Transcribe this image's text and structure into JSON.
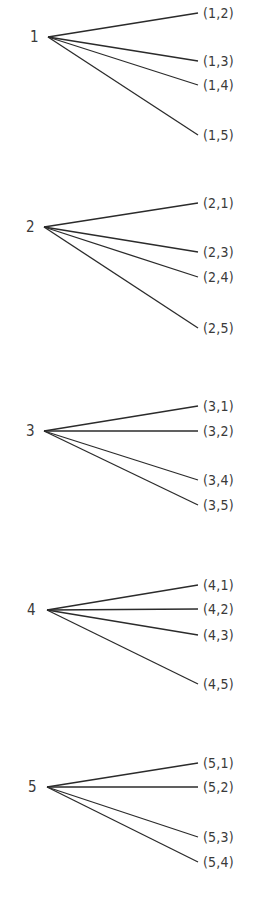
{
  "diagram": {
    "type": "tree",
    "line_color": "#2b2b2b",
    "text_color": "#3a3a3a",
    "groups": [
      {
        "root": "1",
        "root_x": 30,
        "node_x": 48,
        "y": 37,
        "leaves": [
          {
            "label": "(1,2)",
            "y": 13
          },
          {
            "label": "(1,3)",
            "y": 61
          },
          {
            "label": "(1,4)",
            "y": 85
          },
          {
            "label": "(1,5)",
            "y": 135
          }
        ]
      },
      {
        "root": "2",
        "root_x": 26,
        "node_x": 44,
        "y": 227,
        "leaves": [
          {
            "label": "(2,1)",
            "y": 203
          },
          {
            "label": "(2,3)",
            "y": 252
          },
          {
            "label": "(2,4)",
            "y": 277
          },
          {
            "label": "(2,5)",
            "y": 328
          }
        ]
      },
      {
        "root": "3",
        "root_x": 26,
        "node_x": 44,
        "y": 431,
        "leaves": [
          {
            "label": "(3,1)",
            "y": 406
          },
          {
            "label": "(3,2)",
            "y": 431
          },
          {
            "label": "(3,4)",
            "y": 480
          },
          {
            "label": "(3,5)",
            "y": 505
          }
        ]
      },
      {
        "root": "4",
        "root_x": 27,
        "node_x": 47,
        "y": 610,
        "leaves": [
          {
            "label": "(4,1)",
            "y": 585
          },
          {
            "label": "(4,2)",
            "y": 609
          },
          {
            "label": "(4,3)",
            "y": 635
          },
          {
            "label": "(4,5)",
            "y": 684
          }
        ]
      },
      {
        "root": "5",
        "root_x": 28,
        "node_x": 47,
        "y": 787,
        "leaves": [
          {
            "label": "(5,1)",
            "y": 763
          },
          {
            "label": "(5,2)",
            "y": 787
          },
          {
            "label": "(5,3)",
            "y": 837
          },
          {
            "label": "(5,4)",
            "y": 862
          }
        ]
      }
    ],
    "leaf_line_end_x": 198,
    "leaf_label_x": 203
  }
}
